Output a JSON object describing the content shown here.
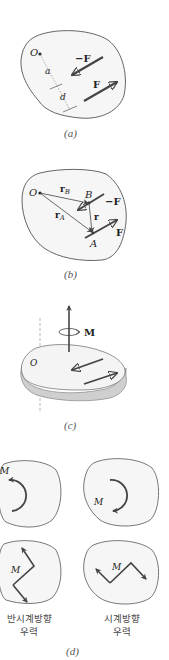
{
  "figure": {
    "panel_a": {
      "caption": "(a)",
      "labels": {
        "origin": "O",
        "neg_force": "−F",
        "force": "F",
        "dist_a": "a",
        "dist_d": "d"
      }
    },
    "panel_b": {
      "caption": "(b)",
      "labels": {
        "origin": "O",
        "rB": "r",
        "rB_sub": "B",
        "rA": "r",
        "rA_sub": "A",
        "r": "r",
        "pointB": "B",
        "pointA": "A",
        "neg_force": "−F",
        "force": "F"
      }
    },
    "panel_c": {
      "caption": "(c)",
      "labels": {
        "origin": "O",
        "moment": "M"
      }
    },
    "panel_d": {
      "caption": "(d)",
      "labels": {
        "m1": "M",
        "m2": "M",
        "m3": "M",
        "m4": "M"
      },
      "left_label_line1": "반시계방향",
      "left_label_line2": "우력",
      "right_label_line1": "시계방향",
      "right_label_line2": "우력"
    }
  },
  "colors": {
    "outline": "#555555",
    "fill": "#f4f4f4",
    "arrow": "#444444",
    "text": "#222222"
  }
}
